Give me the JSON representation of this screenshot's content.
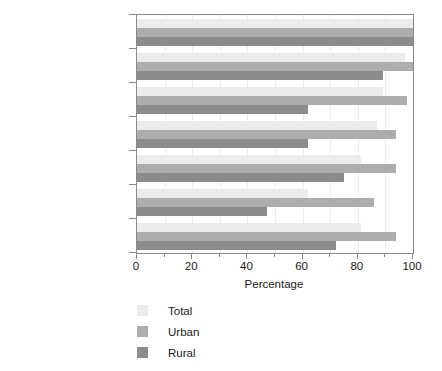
{
  "chart_data": {
    "type": "bar",
    "orientation": "horizontal",
    "title": "",
    "subtitle": "",
    "xlabel": "Percentage",
    "ylabel": "",
    "xlim": [
      0,
      100
    ],
    "xticks": [
      0,
      20,
      40,
      60,
      80,
      100
    ],
    "xticklabels": [
      "0",
      "20",
      "40",
      "60",
      "80",
      "100"
    ],
    "minor_xticks": [
      10,
      30,
      50,
      70,
      90
    ],
    "grid": "vertical",
    "legend_position": "below-axes-left",
    "categories": [
      "North America",
      "Europe",
      "Oceania",
      "Latin America and\nCaribbean",
      "Asia",
      "Africa",
      "Global"
    ],
    "series": [
      {
        "name": "Total",
        "color": "#ececec",
        "values": [
          100,
          97,
          89,
          87,
          81,
          62,
          81
        ]
      },
      {
        "name": "Urban",
        "color": "#adadad",
        "values": [
          100,
          100,
          98,
          94,
          94,
          86,
          94
        ]
      },
      {
        "name": "Rural",
        "color": "#8c8c8c",
        "values": [
          100,
          89,
          62,
          62,
          75,
          47,
          72
        ]
      }
    ]
  },
  "axis": {
    "x_title": "Percentage"
  },
  "legend": {
    "items": [
      {
        "label": "Total",
        "color": "#ececec"
      },
      {
        "label": "Urban",
        "color": "#adadad"
      },
      {
        "label": "Rural",
        "color": "#8c8c8c"
      }
    ]
  }
}
